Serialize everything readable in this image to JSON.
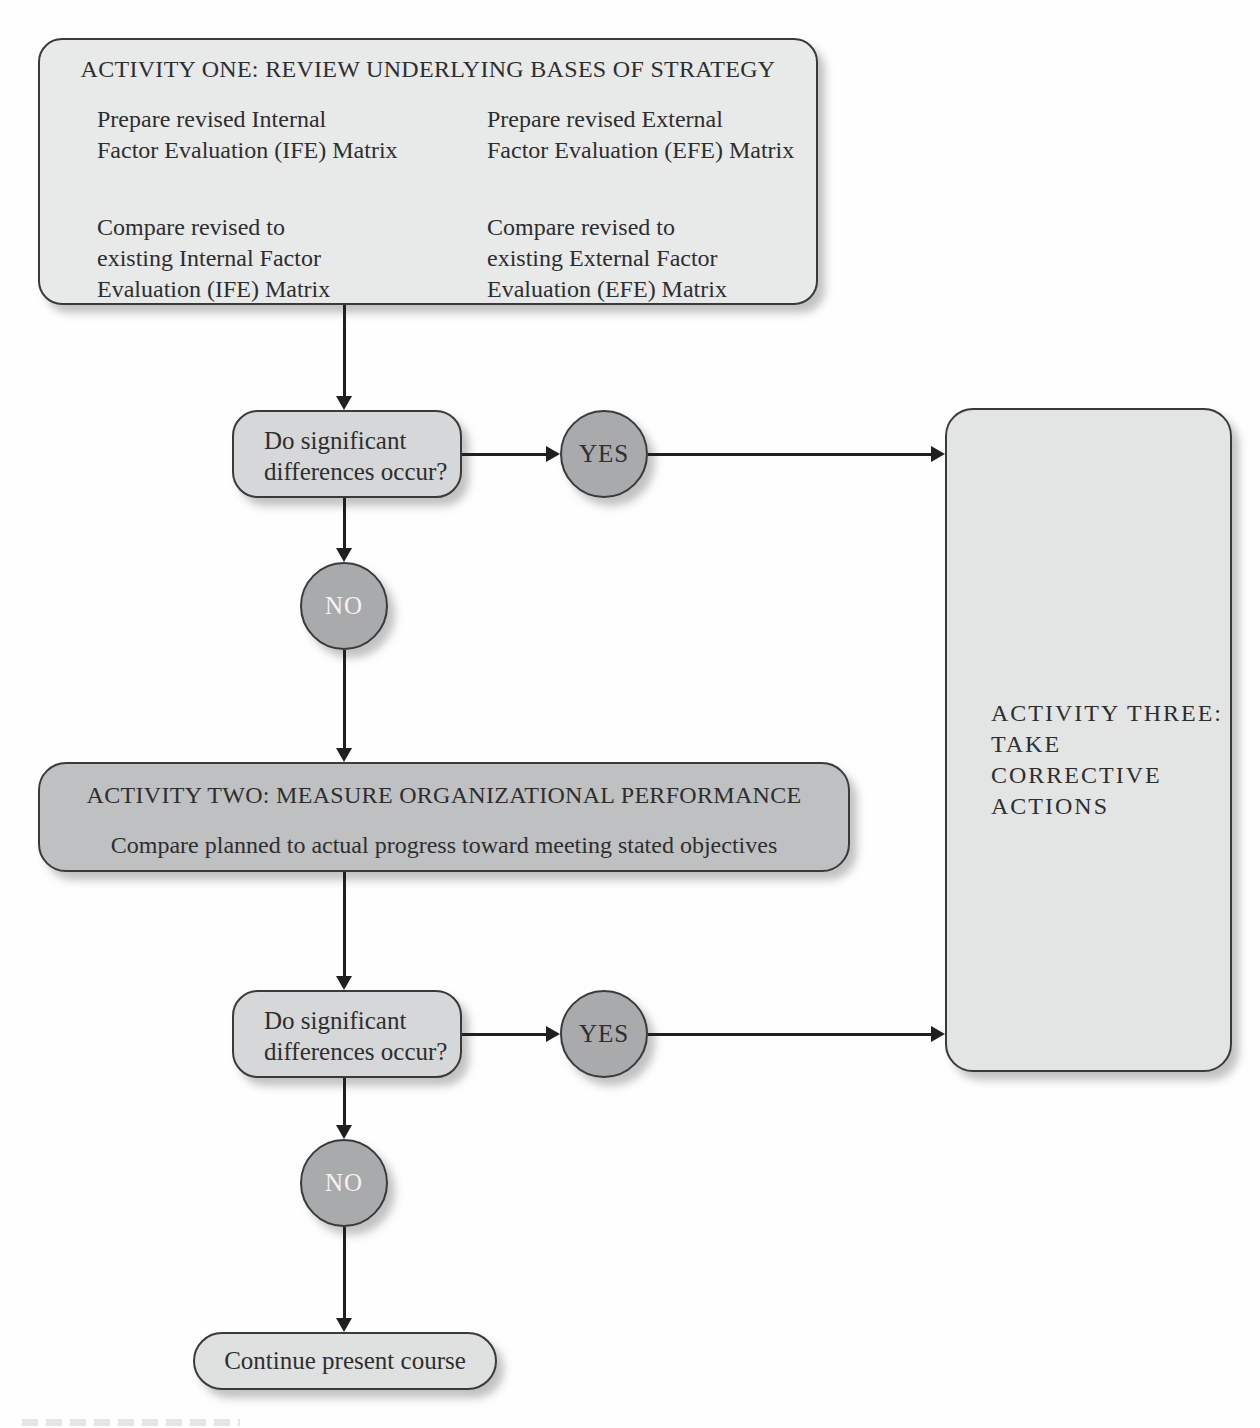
{
  "figure": {
    "type": "flowchart"
  },
  "colors": {
    "background": "#fefefe",
    "activity_one_fill": "#e8e9e9",
    "activity_two_fill": "#bec0c1",
    "activity_three_fill": "#e3e4e4",
    "decision_fill": "#d6d7d8",
    "circle_fill": "#a8aaab",
    "continue_fill": "#dfe0e0",
    "border": "#3a3a3a",
    "connector": "#1f1f1f",
    "yes_text": "#2f2f2f",
    "no_text": "#f3f3f3"
  },
  "nodes": {
    "activity_one": {
      "title": "ACTIVITY ONE: REVIEW UNDERLYING BASES OF STRATEGY",
      "cells": [
        {
          "lines": [
            "Prepare revised Internal",
            "Factor Evaluation (IFE) Matrix"
          ]
        },
        {
          "lines": [
            "Prepare revised External",
            "Factor Evaluation (EFE) Matrix"
          ]
        },
        {
          "lines": [
            "Compare revised to",
            "existing Internal Factor",
            "Evaluation (IFE) Matrix"
          ]
        },
        {
          "lines": [
            "Compare revised to",
            "existing External Factor",
            "Evaluation (EFE) Matrix"
          ]
        }
      ]
    },
    "decision_one": {
      "lines": [
        "Do significant",
        "differences occur?"
      ]
    },
    "yes_one": {
      "label": "YES"
    },
    "no_one": {
      "label": "NO"
    },
    "activity_two": {
      "title": "ACTIVITY TWO: MEASURE ORGANIZATIONAL PERFORMANCE",
      "subtitle": "Compare planned to actual progress toward meeting stated objectives"
    },
    "decision_two": {
      "lines": [
        "Do significant",
        "differences occur?"
      ]
    },
    "yes_two": {
      "label": "YES"
    },
    "no_two": {
      "label": "NO"
    },
    "activity_three": {
      "lines": [
        "ACTIVITY THREE:",
        "TAKE CORRECTIVE",
        "ACTIONS"
      ]
    },
    "continue_node": {
      "label": "Continue present course"
    }
  }
}
